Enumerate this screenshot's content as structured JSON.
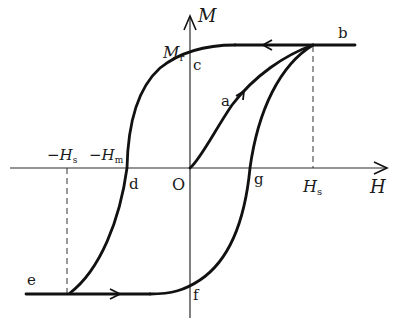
{
  "diagram": {
    "axes": {
      "x_label": "H",
      "y_label": "M",
      "origin_label": "O"
    },
    "tick_labels": {
      "remanence": "M",
      "remanence_sub": "r",
      "saturation_pos": "H",
      "saturation_pos_sub": "s",
      "saturation_neg": "−H",
      "saturation_neg_sub": "s",
      "coercive_neg": "−H",
      "coercive_neg_sub": "m"
    },
    "points": {
      "a": "a",
      "b": "b",
      "c": "c",
      "d": "d",
      "e": "e",
      "f": "f",
      "g": "g"
    },
    "path_description": [
      "O → a → b : initial magnetization curve",
      "b → c : demagnetization to remanence Mr",
      "c → d : reverse field to coercivity −Hm",
      "d → e : reverse saturation at −Hs",
      "e → f → g → b : return branch"
    ],
    "colors": {
      "curve": "#111111",
      "axis": "#2a2a2a",
      "background": "#ffffff"
    }
  }
}
